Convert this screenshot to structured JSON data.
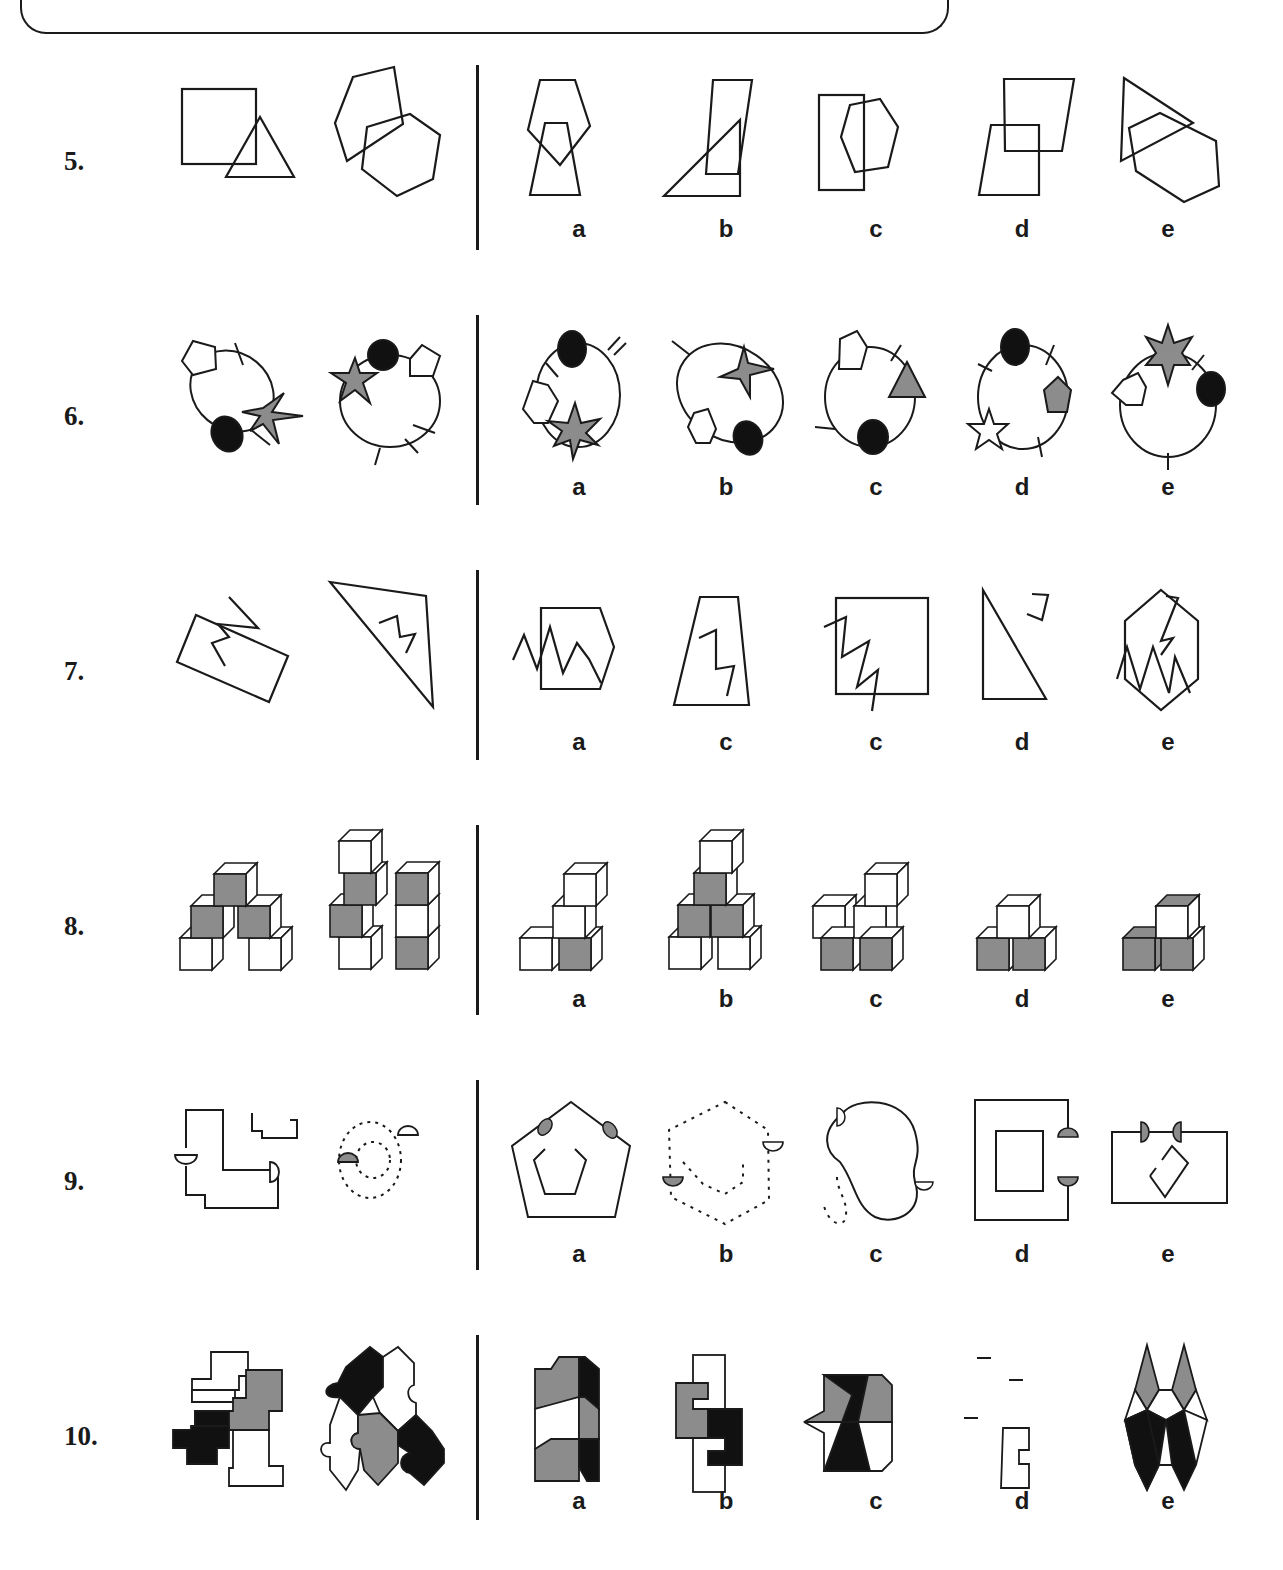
{
  "page": {
    "type": "odd-one-out / classification puzzle sheet",
    "colors": {
      "stroke": "#1a1a1a",
      "gray_fill": "#8c8c8c",
      "black_fill": "#111111",
      "background": "#ffffff"
    }
  },
  "option_labels": [
    "a",
    "b",
    "c",
    "d",
    "e"
  ],
  "questions": [
    {
      "number": "5.",
      "examples": [
        "square overlapping triangle",
        "pentagon overlapping hexagon"
      ],
      "options": [
        {
          "label": "a",
          "desc": "pentagon overlapping trapezoid"
        },
        {
          "label": "b",
          "desc": "parallelogram overlapping right triangle"
        },
        {
          "label": "c",
          "desc": "rectangle overlapping hexagon"
        },
        {
          "label": "d",
          "desc": "quadrilateral overlapping trapezoid"
        },
        {
          "label": "e",
          "desc": "triangle overlapping hexagon"
        }
      ]
    },
    {
      "number": "6.",
      "examples": [
        "ellipse with pentagon, black oval, gray star, 2 ticks",
        "ellipse with gray star, black oval, pentagon, 3 ticks"
      ],
      "options": [
        {
          "label": "a",
          "desc": "ellipse with black oval, pentagon, gray star, ticks"
        },
        {
          "label": "b",
          "desc": "ellipse with gray star, pentagon, black oval, tick"
        },
        {
          "label": "c",
          "desc": "ellipse with pentagon, gray triangle, black oval, ticks"
        },
        {
          "label": "d",
          "desc": "ellipse with black oval, gray pentagon, white star, ticks"
        },
        {
          "label": "e",
          "desc": "ellipse with gray star, black oval, pentagon, ticks"
        }
      ]
    },
    {
      "number": "7.",
      "examples": [
        "rectangle with zigzag",
        "triangle with zigzag"
      ],
      "options": [
        {
          "label": "a",
          "desc": "hexagon with zigzag"
        },
        {
          "label": "b",
          "desc": "trapezoid with zigzag"
        },
        {
          "label": "c",
          "desc": "square with zigzag"
        },
        {
          "label": "d",
          "desc": "right triangle with separate zigzag"
        },
        {
          "label": "e",
          "desc": "hexagon with two zigzags"
        }
      ]
    },
    {
      "number": "8.",
      "examples": [
        "cube pyramid (5 cubes, 3 gray)",
        "two cube stacks (6 cubes, 3 gray)"
      ],
      "options": [
        {
          "label": "a",
          "desc": "4 cubes, 1 gray"
        },
        {
          "label": "b",
          "desc": "6 cubes, 3 gray"
        },
        {
          "label": "c",
          "desc": "5 cubes, 2 gray"
        },
        {
          "label": "d",
          "desc": "3 cubes, 2 gray"
        },
        {
          "label": "e",
          "desc": "3 cubes, 2 gray"
        }
      ]
    },
    {
      "number": "9.",
      "examples": [
        "solid line shapes with 2 white half-circles",
        "dotted ovals with gray and white half-circle"
      ],
      "options": [
        {
          "label": "a",
          "desc": "nested pentagons with 2 gray half-circles"
        },
        {
          "label": "b",
          "desc": "dotted hexagons with gray and white half-circle"
        },
        {
          "label": "c",
          "desc": "blob with 2 white half-circles and dotted tail"
        },
        {
          "label": "d",
          "desc": "nested rectangles with 2 gray half-circles"
        },
        {
          "label": "e",
          "desc": "rectangle with 2 gray half-circles and inner shape"
        }
      ]
    },
    {
      "number": "10.",
      "examples": [
        "block tiling: white, gray, black, white",
        "jigsaw tiling: black, white, white, gray, black"
      ],
      "options": [
        {
          "label": "a",
          "desc": "gray/black/white chevron tiling"
        },
        {
          "label": "b",
          "desc": "gray/black/white hook tiling"
        },
        {
          "label": "c",
          "desc": "arrow tiling gray/black/white"
        },
        {
          "label": "d",
          "desc": "jigsaw tiling white/gray/black"
        },
        {
          "label": "e",
          "desc": "diamond tiling gray/white/black"
        }
      ]
    }
  ]
}
